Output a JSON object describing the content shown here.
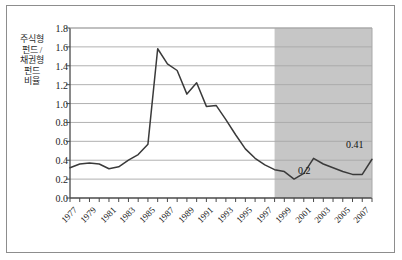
{
  "chart_data": {
    "type": "line",
    "title": "",
    "xlabel": "",
    "ylabel": "주식형 펀드 / 채권형 펀드 비율",
    "ylim": [
      0.0,
      1.8
    ],
    "xlim": [
      1977,
      2008
    ],
    "ytick_labels": [
      "0.0",
      "0.2",
      "0.4",
      "0.6",
      "0.8",
      "1.0",
      "1.2",
      "1.4",
      "1.6",
      "1.8"
    ],
    "ytick_values": [
      0.0,
      0.2,
      0.4,
      0.6,
      0.8,
      1.0,
      1.2,
      1.4,
      1.6,
      1.8
    ],
    "xtick_labels": [
      "1977",
      "1979",
      "1981",
      "1983",
      "1985",
      "1987",
      "1989",
      "1991",
      "1993",
      "1995",
      "1997",
      "1999",
      "2001",
      "2003",
      "2005",
      "2007"
    ],
    "xtick_values": [
      1977,
      1979,
      1981,
      1983,
      1985,
      1987,
      1989,
      1991,
      1993,
      1995,
      1997,
      1999,
      2001,
      2003,
      2005,
      2007
    ],
    "grid": "horizontal",
    "legend": "none",
    "x": [
      1977,
      1978,
      1979,
      1980,
      1981,
      1982,
      1983,
      1984,
      1985,
      1986,
      1987,
      1988,
      1989,
      1990,
      1991,
      1992,
      1993,
      1994,
      1995,
      1996,
      1997,
      1998,
      1999,
      2000,
      2001,
      2002,
      2003,
      2004,
      2005,
      2006,
      2007,
      2008
    ],
    "values": [
      0.32,
      0.36,
      0.37,
      0.36,
      0.31,
      0.33,
      0.4,
      0.46,
      0.57,
      1.58,
      1.42,
      1.35,
      1.1,
      1.22,
      0.97,
      0.98,
      0.83,
      0.67,
      0.52,
      0.42,
      0.35,
      0.3,
      0.28,
      0.2,
      0.26,
      0.42,
      0.36,
      0.32,
      0.28,
      0.25,
      0.25,
      0.41
    ],
    "series_name": "주식형 펀드 / 채권형 펀드 비율",
    "line_color": "#3a3a3a",
    "shaded_region": {
      "start": 1998,
      "end": 2008,
      "color": "#c6c6c6",
      "label": ""
    },
    "annotations": [
      {
        "text": "0.2",
        "x": 2000,
        "y": 0.2
      },
      {
        "text": "0.41",
        "x": 2008,
        "y": 0.41
      }
    ]
  },
  "colors": {
    "border": "#8d8d8d",
    "grid": "#a8a8a8",
    "axis": "#4a4a4a",
    "line": "#3a3a3a",
    "shade": "#c6c6c6",
    "background": "#ffffff",
    "text": "#1d1d1d"
  }
}
